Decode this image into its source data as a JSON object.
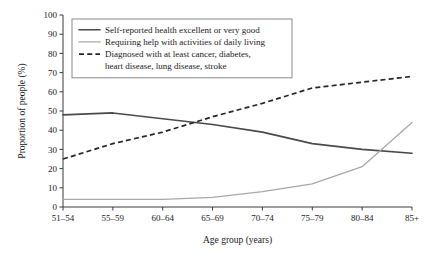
{
  "chart_data": {
    "type": "line",
    "title": "",
    "xlabel": "Age group (years)",
    "ylabel": "Proportion of people (%)",
    "categories": [
      "51–54",
      "55–59",
      "60–64",
      "65–69",
      "70–74",
      "75–79",
      "80–84",
      "85+"
    ],
    "ylim": [
      0,
      100
    ],
    "yticks": [
      0,
      10,
      20,
      30,
      40,
      50,
      60,
      70,
      80,
      90,
      100
    ],
    "ytick_labels": [
      "0",
      "10",
      "20",
      "30",
      "40",
      "50",
      "60",
      "70",
      "80",
      "90",
      "100"
    ],
    "grid": false,
    "legend_position": "upper-left-inside",
    "series": [
      {
        "name": "Self-reported health excellent or very good",
        "style": "solid",
        "color": "#4a4a4a",
        "values": [
          48,
          49,
          46,
          43,
          39,
          33,
          30,
          28
        ]
      },
      {
        "name": "Requiring help with activities of daily living",
        "style": "solid",
        "color": "#a8a8a8",
        "values": [
          4,
          4,
          4,
          5,
          8,
          12,
          21,
          44
        ]
      },
      {
        "name": "Diagnosed with at least cancer, diabetes, heart disease, lung disease, stroke",
        "style": "dashed",
        "color": "#262626",
        "values": [
          25,
          33,
          39,
          47,
          54,
          62,
          65,
          68
        ]
      }
    ],
    "legend": [
      {
        "label": "Self-reported health excellent or very good",
        "style": "solid",
        "color": "#4a4a4a",
        "lines": [
          "Self-reported health excellent or very good"
        ]
      },
      {
        "label": "Requiring help with activities of daily living",
        "style": "solid",
        "color": "#a8a8a8",
        "lines": [
          "Requiring help with activities of daily living"
        ]
      },
      {
        "label": "Diagnosed with at least cancer, diabetes, heart disease, lung disease, stroke",
        "style": "dashed",
        "color": "#262626",
        "lines": [
          "Diagnosed with at least cancer, diabetes,",
          "heart disease, lung disease, stroke"
        ]
      }
    ]
  }
}
